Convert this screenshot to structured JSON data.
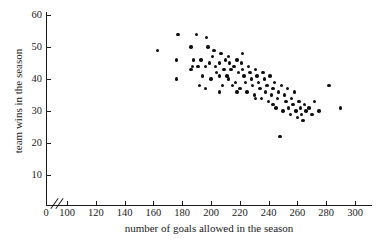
{
  "chart_data": {
    "type": "scatter",
    "title": "",
    "xlabel": "number of goals allowed in the season",
    "ylabel": "team wins in the season",
    "xlim": [
      90,
      305
    ],
    "ylim": [
      0,
      64
    ],
    "grid": false,
    "legend": null,
    "axis_break_x": true,
    "xticks": [
      0,
      100,
      120,
      140,
      160,
      180,
      200,
      220,
      240,
      260,
      280,
      300
    ],
    "yticks": [
      10,
      20,
      30,
      40,
      50,
      60
    ],
    "points": [
      [
        163,
        49
      ],
      [
        177,
        54
      ],
      [
        176,
        46
      ],
      [
        176,
        40
      ],
      [
        190,
        54
      ],
      [
        197,
        53
      ],
      [
        198,
        50
      ],
      [
        188,
        46
      ],
      [
        187,
        44
      ],
      [
        186,
        43
      ],
      [
        191,
        44
      ],
      [
        193,
        46
      ],
      [
        196,
        44
      ],
      [
        194,
        41
      ],
      [
        192,
        38
      ],
      [
        196,
        37
      ],
      [
        199,
        45
      ],
      [
        201,
        47
      ],
      [
        203,
        44
      ],
      [
        204,
        42
      ],
      [
        206,
        45
      ],
      [
        207,
        48
      ],
      [
        209,
        43
      ],
      [
        211,
        41
      ],
      [
        208,
        38
      ],
      [
        206,
        36
      ],
      [
        210,
        46
      ],
      [
        213,
        45
      ],
      [
        214,
        43
      ],
      [
        212,
        40
      ],
      [
        215,
        38
      ],
      [
        216,
        44
      ],
      [
        218,
        46
      ],
      [
        219,
        42
      ],
      [
        217,
        39
      ],
      [
        221,
        45
      ],
      [
        222,
        43
      ],
      [
        223,
        41
      ],
      [
        220,
        37
      ],
      [
        224,
        39
      ],
      [
        226,
        44
      ],
      [
        227,
        42
      ],
      [
        228,
        40
      ],
      [
        225,
        36
      ],
      [
        229,
        38
      ],
      [
        231,
        43
      ],
      [
        232,
        41
      ],
      [
        230,
        35
      ],
      [
        233,
        39
      ],
      [
        234,
        37
      ],
      [
        236,
        42
      ],
      [
        237,
        40
      ],
      [
        235,
        34
      ],
      [
        238,
        36
      ],
      [
        239,
        38
      ],
      [
        241,
        41
      ],
      [
        242,
        35
      ],
      [
        240,
        33
      ],
      [
        243,
        37
      ],
      [
        244,
        39
      ],
      [
        246,
        34
      ],
      [
        247,
        36
      ],
      [
        245,
        31
      ],
      [
        248,
        22
      ],
      [
        249,
        38
      ],
      [
        251,
        35
      ],
      [
        252,
        33
      ],
      [
        250,
        30
      ],
      [
        253,
        37
      ],
      [
        254,
        31
      ],
      [
        256,
        34
      ],
      [
        257,
        32
      ],
      [
        255,
        29
      ],
      [
        258,
        36
      ],
      [
        259,
        30
      ],
      [
        261,
        33
      ],
      [
        262,
        31
      ],
      [
        260,
        28
      ],
      [
        263,
        29
      ],
      [
        265,
        32
      ],
      [
        266,
        30
      ],
      [
        264,
        27
      ],
      [
        268,
        31
      ],
      [
        270,
        29
      ],
      [
        272,
        33
      ],
      [
        275,
        30
      ],
      [
        282,
        38
      ],
      [
        290,
        31
      ],
      [
        206,
        41
      ],
      [
        212,
        47
      ],
      [
        200,
        40
      ],
      [
        218,
        36
      ],
      [
        231,
        34
      ],
      [
        243,
        32
      ],
      [
        186,
        50
      ],
      [
        202,
        49
      ],
      [
        222,
        48
      ]
    ]
  }
}
